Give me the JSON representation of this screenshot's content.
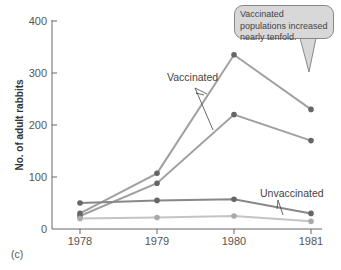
{
  "chart_data": {
    "type": "line",
    "title": "",
    "panel_label": "(c)",
    "xlabel": "",
    "ylabel": "No. of adult rabbits",
    "categories": [
      "1978",
      "1979",
      "1980",
      "1981"
    ],
    "yticks": [
      0,
      100,
      200,
      300,
      400
    ],
    "ylim": [
      0,
      400
    ],
    "grid": false,
    "series": [
      {
        "name": "Vaccinated (population 1)",
        "group": "Vaccinated",
        "values": [
          30,
          107,
          335,
          230
        ]
      },
      {
        "name": "Vaccinated (population 2)",
        "group": "Vaccinated",
        "values": [
          25,
          88,
          220,
          170
        ]
      },
      {
        "name": "Unvaccinated (population 1)",
        "group": "Unvaccinated",
        "values": [
          50,
          55,
          57,
          30
        ]
      },
      {
        "name": "Unvaccinated (population 2)",
        "group": "Unvaccinated",
        "values": [
          20,
          22,
          25,
          15
        ]
      }
    ],
    "annotations": [
      {
        "text": "Vaccinated",
        "points_to": [
          "Vaccinated (population 1)",
          "Vaccinated (population 2)"
        ]
      },
      {
        "text": "Unvaccinated",
        "points_to": [
          "Unvaccinated (population 1)",
          "Unvaccinated (population 2)"
        ]
      },
      {
        "text": "Vaccinated populations increased nearly tenfold.",
        "type": "callout",
        "points_to": "1981"
      }
    ],
    "colors": {
      "vaccinated_line": "#a0a0a0",
      "unvaccinated_dark": "#888888",
      "unvaccinated_light": "#c4c4c4",
      "marker": "#666666",
      "axis": "#666666"
    }
  },
  "labels": {
    "ylabel": "No. of adult rabbits",
    "vaccinated": "Vaccinated",
    "unvaccinated": "Unvaccinated",
    "callout": "Vaccinated populations increased nearly tenfold.",
    "panel": "(c)",
    "x": [
      "1978",
      "1979",
      "1980",
      "1981"
    ],
    "y": [
      "0",
      "100",
      "200",
      "300",
      "400"
    ]
  }
}
